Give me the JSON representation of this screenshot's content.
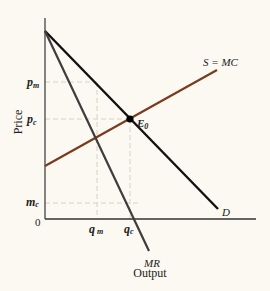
{
  "diagram": {
    "type": "monopoly-vs-competition supply/demand diagram",
    "axes": {
      "x_label": "Output",
      "y_label": "Price",
      "origin_label": "0"
    },
    "y_ticks": [
      {
        "id": "pm",
        "label": "p",
        "sub": "m"
      },
      {
        "id": "pc",
        "label": "p",
        "sub": "c"
      },
      {
        "id": "mc",
        "label": "m",
        "sub": "c"
      }
    ],
    "x_ticks": [
      {
        "id": "qm",
        "label": "q",
        "sub": "m"
      },
      {
        "id": "qc",
        "label": "q",
        "sub": "c"
      }
    ],
    "curves": [
      {
        "id": "demand",
        "label": "D",
        "color": "#111111"
      },
      {
        "id": "marginal-revenue",
        "label": "MR",
        "color": "#3a3a3a"
      },
      {
        "id": "supply",
        "label": "S = MC",
        "color": "#7a3b1e"
      }
    ],
    "equilibrium": {
      "label": "E",
      "sub": "0"
    },
    "colors": {
      "background": "#fbf9f1",
      "axis": "#333333",
      "guide": "#d8d6cc"
    }
  }
}
